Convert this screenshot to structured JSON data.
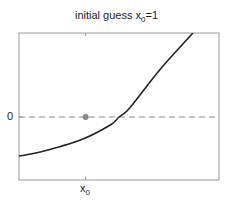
{
  "chart_data": {
    "type": "line",
    "title": "initial guess x0=1",
    "title_parts": {
      "main": "initial guess x",
      "sub": "0",
      "tail": "=1"
    },
    "xlabel": "",
    "ylabel": "",
    "xlim": [
      0,
      3
    ],
    "ylim": [
      -3,
      4
    ],
    "x_ticks": [
      {
        "value": 1,
        "label_main": "x",
        "label_sub": "0"
      }
    ],
    "y_ticks": [
      {
        "value": 0,
        "label": "0"
      }
    ],
    "grid": false,
    "legend": null,
    "series": [
      {
        "name": "f(x)",
        "style": "solid",
        "color": "#222222",
        "x": [
          0,
          0.32,
          0.92,
          1.37,
          1.5,
          1.66,
          2.11,
          2.61
        ],
        "y": [
          -1.86,
          -1.67,
          -1.1,
          -0.38,
          0,
          0.43,
          2.24,
          4
        ]
      }
    ],
    "reference_lines": [
      {
        "type": "horizontal",
        "y": 0,
        "style": "dashed",
        "color": "#888888"
      }
    ],
    "points": [
      {
        "name": "initial guess",
        "x": 1,
        "y": 0,
        "color": "#888888"
      }
    ]
  },
  "layout": {
    "plot_box": {
      "left": 19,
      "top": 33,
      "right": 219,
      "bottom": 180
    },
    "axis_color": "#999999"
  }
}
